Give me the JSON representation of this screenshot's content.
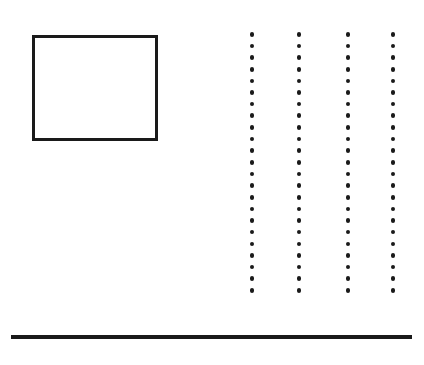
{
  "figure": {
    "title": "",
    "background_color": "#ffffff",
    "width": 424,
    "height": 365,
    "ink_color": "#1a1a1a"
  },
  "elements": {
    "rectangle": {
      "name": "outlined rectangle",
      "x": 32,
      "y": 35,
      "width": 126,
      "height": 106,
      "border_width": 3,
      "border_color": "#1a1a1a",
      "fill_color": "#ffffff"
    },
    "dot_grid": {
      "name": "four vertical dotted columns",
      "columns": 4,
      "dots_per_column": 23,
      "dot_diameter": 4.6,
      "dot_color": "#1a1a1a",
      "vertical_spacing": 11.65,
      "top_y": 32,
      "bottom_y": 292,
      "column_x": [
        252,
        299,
        348,
        393
      ]
    },
    "horizontal_rule": {
      "name": "thick horizontal bar",
      "x": 11,
      "y": 335,
      "width": 401,
      "height": 4,
      "color": "#1a1a1a"
    }
  }
}
